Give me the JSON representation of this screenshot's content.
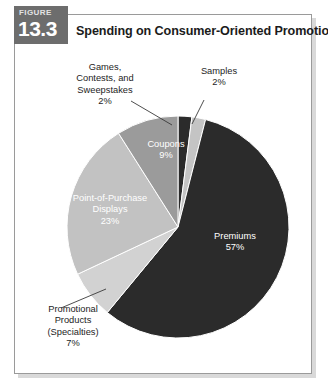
{
  "figure": {
    "tab_word": "FIGURE",
    "tab_number": "13.3",
    "title": "Spending on Consumer-Oriented Promotions"
  },
  "colors": {
    "frame_border": "#9a9a9a",
    "frame_shadow": "#d9d9d9",
    "tab_background": "#6d6d6d",
    "label_text": "#1d1d1d",
    "inside_label_text": "#ffffff",
    "slice_outline": "#ffffff"
  },
  "labels": {
    "games": "Games,\nContests, and\nSweepstakes\n2%",
    "samples": "Samples\n2%",
    "coupons": "Coupons\n9%",
    "point_of_purchase": "Point-of-Purchase\nDisplays\n23%",
    "premiums": "Premiums\n57%",
    "promotional_products": "Promotional\nProducts\n(Specialties)\n7%"
  },
  "chart_data": {
    "type": "pie",
    "title": "Spending on Consumer-Oriented Promotions",
    "xlabel": "",
    "ylabel": "",
    "legend_position": "none",
    "grid": false,
    "value_unit": "percent",
    "start_angle_deg": -90,
    "direction": "clockwise",
    "categories": [
      "Games, Contests, and Sweepstakes",
      "Samples",
      "Premiums",
      "Promotional Products (Specialties)",
      "Point-of-Purchase Displays",
      "Coupons"
    ],
    "values": [
      2,
      2,
      57,
      7,
      23,
      9
    ],
    "labels": [
      "Games,\nContests, and\nSweepstakes\n2%",
      "Samples\n2%",
      "Premiums\n57%",
      "Promotional\nProducts\n(Specialties)\n7%",
      "Point-of-Purchase\nDisplays\n23%",
      "Coupons\n9%"
    ],
    "slice_colors": [
      "#2b2b2b",
      "#c4c4c4",
      "#2b2b2b",
      "#d2d2d2",
      "#c2c2c2",
      "#9b9b9b"
    ],
    "label_placement": [
      "outside-leader",
      "outside-leader",
      "inside",
      "outside-leader",
      "inside",
      "inside"
    ],
    "geometry": {
      "center_x": 178,
      "center_y": 227,
      "radius": 111
    }
  }
}
